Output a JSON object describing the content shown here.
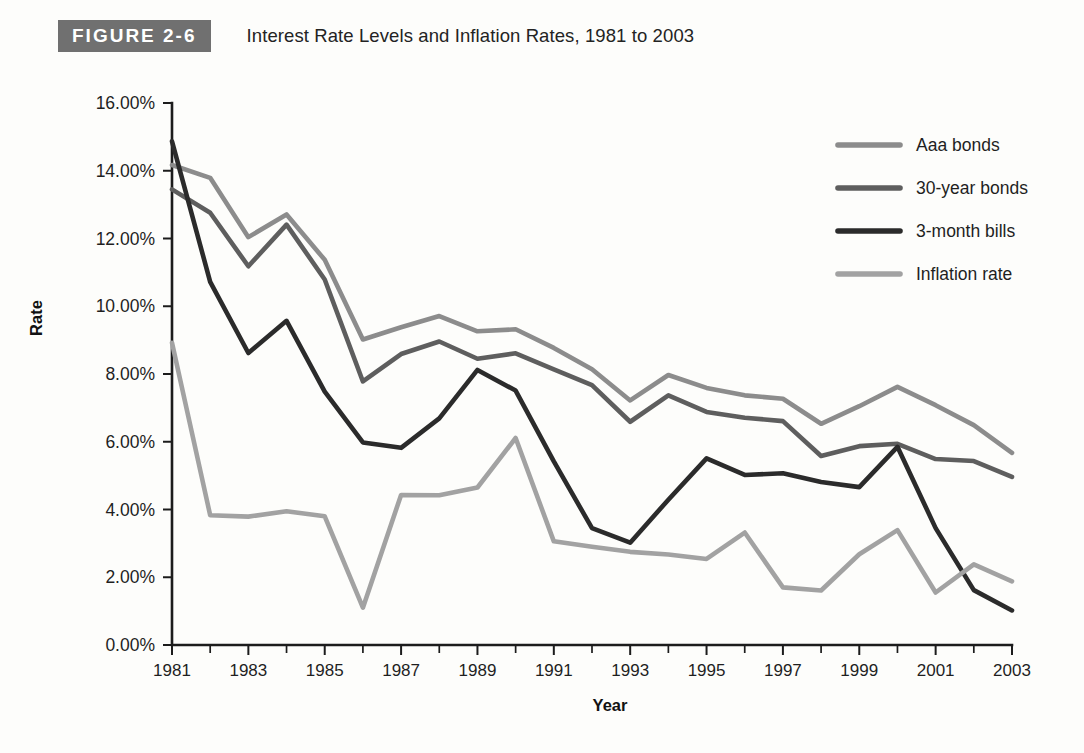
{
  "figure": {
    "badge": "FIGURE 2-6",
    "title": "Interest Rate Levels and Inflation Rates, 1981 to 2003",
    "badge_bg": "#707070"
  },
  "chart_data": {
    "type": "line",
    "title": "Interest Rate Levels and Inflation Rates, 1981 to 2003",
    "xlabel": "Year",
    "ylabel": "Rate",
    "xlim": [
      1981,
      2003
    ],
    "ylim": [
      0,
      16
    ],
    "grid": false,
    "legend_position": "top-right",
    "x": [
      1981,
      1982,
      1983,
      1984,
      1985,
      1986,
      1987,
      1988,
      1989,
      1990,
      1991,
      1992,
      1993,
      1994,
      1995,
      1996,
      1997,
      1998,
      1999,
      2000,
      2001,
      2002,
      2003
    ],
    "xtick_labels": [
      "1981",
      "1983",
      "1985",
      "1987",
      "1989",
      "1991",
      "1993",
      "1995",
      "1997",
      "1999",
      "2001",
      "2003"
    ],
    "xticks_major": [
      1981,
      1983,
      1985,
      1987,
      1989,
      1991,
      1993,
      1995,
      1997,
      1999,
      2001,
      2003
    ],
    "ytick_labels": [
      "0.00%",
      "2.00%",
      "4.00%",
      "6.00%",
      "8.00%",
      "10.00%",
      "12.00%",
      "14.00%",
      "16.00%"
    ],
    "yticks": [
      0,
      2,
      4,
      6,
      8,
      10,
      12,
      14,
      16
    ],
    "series": [
      {
        "name": "Aaa bonds",
        "color": "#8c8c8c",
        "values": [
          14.17,
          13.79,
          12.04,
          12.71,
          11.37,
          9.02,
          9.38,
          9.71,
          9.26,
          9.32,
          8.77,
          8.14,
          7.22,
          7.97,
          7.59,
          7.37,
          7.27,
          6.53,
          7.05,
          7.62,
          7.08,
          6.49,
          5.67
        ]
      },
      {
        "name": "30-year bonds",
        "color": "#5e5e5e",
        "values": [
          13.45,
          12.76,
          11.18,
          12.41,
          10.79,
          7.78,
          8.59,
          8.96,
          8.45,
          8.61,
          8.14,
          7.67,
          6.59,
          7.37,
          6.88,
          6.71,
          6.61,
          5.58,
          5.87,
          5.94,
          5.49,
          5.43,
          4.96
        ]
      },
      {
        "name": "3-month bills",
        "color": "#2b2b2b",
        "values": [
          14.87,
          10.72,
          8.62,
          9.57,
          7.48,
          5.98,
          5.82,
          6.69,
          8.12,
          7.51,
          5.42,
          3.45,
          3.02,
          4.29,
          5.51,
          5.02,
          5.07,
          4.81,
          4.66,
          5.85,
          3.45,
          1.62,
          1.02
        ]
      },
      {
        "name": "Inflation rate",
        "color": "#a2a2a2",
        "values": [
          8.92,
          3.83,
          3.79,
          3.95,
          3.8,
          1.1,
          4.43,
          4.42,
          4.65,
          6.11,
          3.06,
          2.9,
          2.75,
          2.67,
          2.54,
          3.32,
          1.7,
          1.61,
          2.68,
          3.39,
          1.55,
          2.38,
          1.88
        ]
      }
    ]
  },
  "legend": {
    "items": [
      {
        "label": "Aaa bonds",
        "color": "#8c8c8c"
      },
      {
        "label": "30-year bonds",
        "color": "#5e5e5e"
      },
      {
        "label": "3-month bills",
        "color": "#2b2b2b"
      },
      {
        "label": "Inflation rate",
        "color": "#a2a2a2"
      }
    ]
  },
  "axes": {
    "y_title": "Rate",
    "x_title": "Year"
  }
}
